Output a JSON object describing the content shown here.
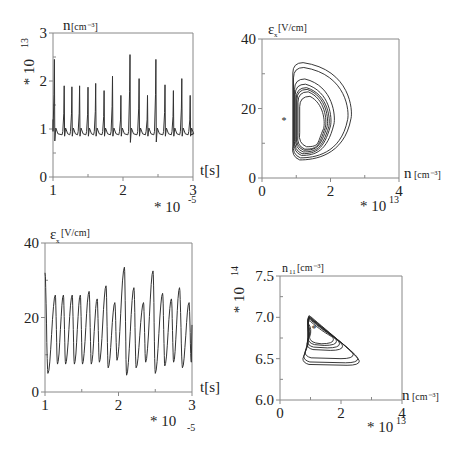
{
  "figure": {
    "panels": [
      {
        "id": "n-vs-t",
        "y_label_symbol": "n",
        "y_label_unit": "[cm⁻³]",
        "y_multiplier": "* 10",
        "y_multiplier_exp": "13",
        "x_label": "t[s]",
        "x_multiplier": "* 10",
        "x_multiplier_exp": "-5",
        "y_ticks": [
          "0",
          "1",
          "2",
          "3"
        ],
        "x_ticks": [
          "1",
          "2",
          "3"
        ]
      },
      {
        "id": "ex-vs-n",
        "y_label_symbol": "ε",
        "y_label_sub": "x",
        "y_label_unit": "[V/cm]",
        "x_label_symbol": "n",
        "x_label_unit": "[cm⁻³]",
        "x_multiplier": "* 10",
        "x_multiplier_exp": "13",
        "y_ticks": [
          "0",
          "20",
          "40"
        ],
        "x_ticks": [
          "0",
          "2",
          "4"
        ]
      },
      {
        "id": "ex-vs-t",
        "y_label_symbol": "ε",
        "y_label_sub": "x",
        "y_label_unit": "[V/cm]",
        "x_label": "t[s]",
        "x_multiplier": "* 10",
        "x_multiplier_exp": "-5",
        "y_ticks": [
          "0",
          "20",
          "40"
        ],
        "x_ticks": [
          "1",
          "2",
          "3"
        ]
      },
      {
        "id": "n11-vs-n",
        "y_label_symbol": "n",
        "y_label_sub": "11",
        "y_label_unit": "[cm⁻³]",
        "y_multiplier": "* 10",
        "y_multiplier_exp": "14",
        "x_label_symbol": "n",
        "x_label_unit": "[cm⁻³]",
        "x_multiplier": "* 10",
        "x_multiplier_exp": "13",
        "y_ticks": [
          "6.0",
          "6.5",
          "7.0",
          "7.5"
        ],
        "x_ticks": [
          "0",
          "2",
          "4"
        ]
      }
    ]
  },
  "chart_data": [
    {
      "type": "line",
      "title": "",
      "xlabel": "t [s] (×10⁻⁵)",
      "ylabel": "n [cm⁻³] (×10¹³)",
      "xlim": [
        1,
        3
      ],
      "ylim": [
        0,
        3
      ],
      "grid": false,
      "description": "Relaxation oscillations: baseline ~0.9, sharp spikes",
      "spike_times": [
        1.02,
        1.16,
        1.27,
        1.38,
        1.5,
        1.61,
        1.73,
        1.85,
        1.97,
        2.1,
        2.23,
        2.35,
        2.47,
        2.6,
        2.72,
        2.84,
        2.96
      ],
      "spike_peaks": [
        2.45,
        1.9,
        1.88,
        1.9,
        1.87,
        1.95,
        1.8,
        2.1,
        1.7,
        2.55,
        2.05,
        1.7,
        2.45,
        1.92,
        1.8,
        2.05,
        1.7
      ],
      "baseline": 0.9,
      "minima": [
        0.75,
        0.85,
        0.85,
        0.85,
        0.85,
        0.85,
        0.85,
        0.85,
        0.85,
        0.72,
        0.85,
        0.85,
        0.73,
        0.85,
        0.85,
        0.85,
        0.85
      ]
    },
    {
      "type": "line",
      "title": "",
      "xlabel": "n [cm⁻³] (×10¹³)",
      "ylabel": "εx [V/cm]",
      "xlim": [
        0,
        4
      ],
      "ylim": [
        0,
        40
      ],
      "grid": false,
      "description": "Phase portrait: nested closed orbits, left edge near n≈0.9, extending to n≈2.6, Ex from ~5 to ~33; fixed point marker at (1.1, 16)",
      "fixed_point": [
        1.1,
        16
      ],
      "orbit_extent": {
        "n_min": 0.9,
        "n_max": 2.6,
        "ex_min": 5,
        "ex_max": 33
      }
    },
    {
      "type": "line",
      "title": "",
      "xlabel": "t [s] (×10⁻⁵)",
      "ylabel": "εx [V/cm]",
      "xlim": [
        1,
        3
      ],
      "ylim": [
        0,
        40
      ],
      "grid": false,
      "peak_times": [
        1.0,
        1.14,
        1.25,
        1.37,
        1.48,
        1.6,
        1.71,
        1.83,
        1.95,
        2.08,
        2.21,
        2.34,
        2.47,
        2.6,
        2.72,
        2.83,
        2.96
      ],
      "peak_values": [
        32,
        26,
        26,
        26,
        26,
        27,
        25,
        28.5,
        24,
        33.5,
        28,
        24,
        32.5,
        26.5,
        25,
        28,
        24
      ],
      "trough_times": [
        1.04,
        1.17,
        1.28,
        1.4,
        1.51,
        1.63,
        1.74,
        1.86,
        1.98,
        2.11,
        2.24,
        2.37,
        2.5,
        2.63,
        2.75,
        2.87,
        2.99
      ],
      "trough_values": [
        5,
        7.5,
        7.5,
        7.5,
        7.5,
        7.5,
        8,
        6.5,
        8.5,
        4.5,
        6.5,
        8,
        5,
        7,
        8,
        6.5,
        8
      ],
      "end_value": 18
    },
    {
      "type": "line",
      "title": "",
      "xlabel": "n [cm⁻³] (×10¹³)",
      "ylabel": "n11 [cm⁻³] (×10¹⁴)",
      "xlim": [
        0,
        4
      ],
      "ylim": [
        6.0,
        7.5
      ],
      "grid": false,
      "description": "Phase portrait: nested triangular orbits, apex near (0.95, 7.0), lower-right corner near (2.6, 6.5), bottom near 6.42; fixed point marker at (1.15, 6.85)",
      "fixed_point": [
        1.15,
        6.85
      ],
      "orbit_extent": {
        "n_min": 0.75,
        "n_max": 2.6,
        "n11_min": 6.42,
        "n11_max": 7.02
      }
    }
  ]
}
